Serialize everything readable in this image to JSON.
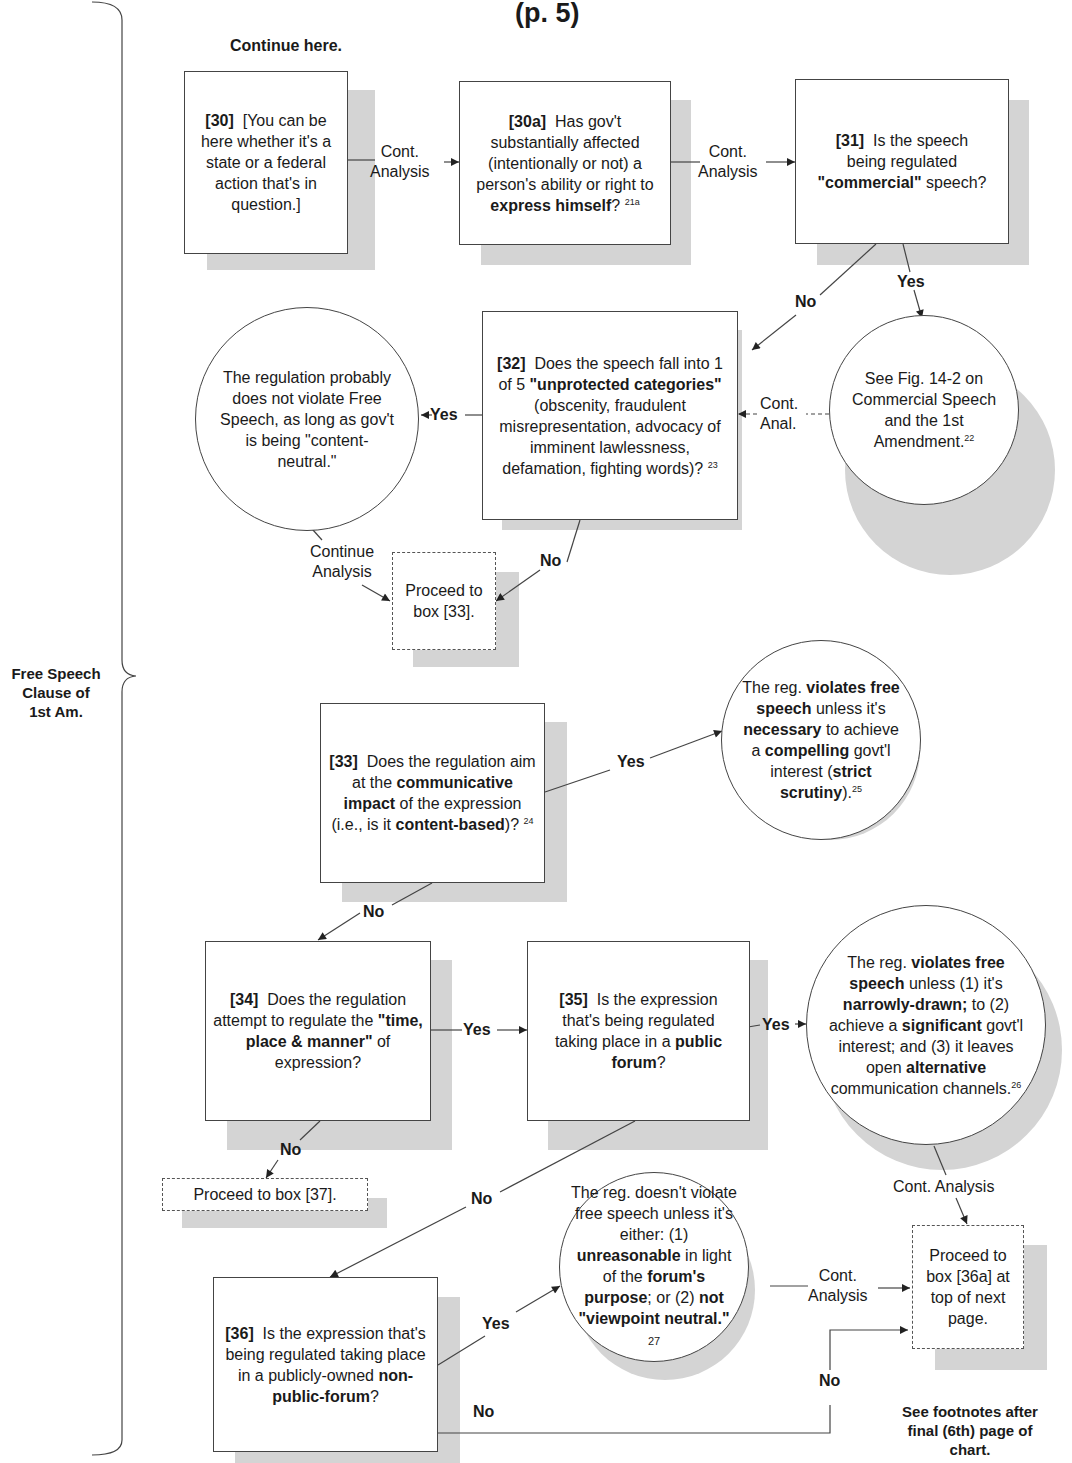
{
  "header": {
    "title": "(p. 5)",
    "continue_here": "Continue here."
  },
  "sidebar": {
    "brace_label_lines": [
      "Free Speech",
      "Clause of",
      "1st Am."
    ]
  },
  "nodes": {
    "n30": {
      "id": "[30]",
      "text": "[You can be here whether it's a state or a federal action that's in question.]"
    },
    "n30a": {
      "id": "[30a]",
      "text_pre": "Has gov't substantially affected (intentionally or not) a person's ability or right to ",
      "text_bold": "express himself",
      "text_post": "?",
      "footnote": "21a"
    },
    "n31": {
      "id": "[31]",
      "text_pre": "Is the speech being regulated ",
      "text_bold": "\"commercial\"",
      "text_post": " speech?"
    },
    "n32": {
      "id": "[32]",
      "text_pre": "Does the speech fall into 1 of 5 ",
      "text_bold": "\"unprotected categories\"",
      "text_post": " (obscenity, fraudulent misrepresentation, advocacy of imminent lawlessness, defamation, fighting words)?",
      "footnote": "23"
    },
    "circle_no_violation": {
      "text": "The regulation probably does not violate Free Speech, as long as gov't is being \"content-neutral.\""
    },
    "circle_commercial": {
      "text": "See Fig. 14-2 on Commercial Speech and the 1st Amendment.",
      "footnote": "22"
    },
    "proceed_33": {
      "text": "Proceed to box [33]."
    },
    "n33": {
      "id": "[33]",
      "t1": "Does the regulation aim at the ",
      "b1": "communicative impact",
      "t2": " of the expression (i.e., is it ",
      "b2": "content-based",
      "t3": ")?",
      "footnote": "24"
    },
    "circle_strict": {
      "t1": "The reg. ",
      "b1": "violates free speech",
      "t2": " unless it's ",
      "b2": "necessary",
      "t3": " to achieve a ",
      "b3": "compelling",
      "t4": " govt'l interest (",
      "b4": "strict scrutiny",
      "t5": ").",
      "footnote": "25"
    },
    "n34": {
      "id": "[34]",
      "text_pre": "Does the regulation attempt to regulate the ",
      "text_bold": "\"time, place & manner\"",
      "text_post": " of expression?"
    },
    "n35": {
      "id": "[35]",
      "text_pre": "Is the expression that's being regulated taking place in a ",
      "text_bold": "public forum",
      "text_post": "?"
    },
    "circle_tpm": {
      "t1": "The reg. ",
      "b1": "violates free speech",
      "t2": " unless (1) it's ",
      "b2": "narrowly-drawn;",
      "t3": " to (2) achieve a ",
      "b3": "significant",
      "t4": " govt'l interest; and (3) it leaves open ",
      "b4": "alternative",
      "t5": " communication channels.",
      "footnote": "26"
    },
    "proceed_37": {
      "text": "Proceed to box [37]."
    },
    "n36": {
      "id": "[36]",
      "text_pre": "Is the expression that's being regulated taking place in a publicly-owned ",
      "text_bold": "non-public-forum",
      "text_post": "?"
    },
    "circle_nonpublic": {
      "t1": "The reg. doesn't violate free speech unless it's either: (1) ",
      "b1": "unreasonable",
      "t2": " in light of the ",
      "b2": "forum's purpose",
      "t3": "; or (2) ",
      "b3": "not \"viewpoint neutral.\"",
      "footnote": "27"
    },
    "proceed_36a": {
      "text": "Proceed to box [36a] at top of next page."
    }
  },
  "edge_labels": {
    "e30_30a": [
      "Cont.",
      "Analysis"
    ],
    "e30a_31": [
      "Cont.",
      "Analysis"
    ],
    "e31_no": "No",
    "e31_yes": "Yes",
    "e32_yes": "Yes",
    "e_comm_32": [
      "Cont.",
      "Anal."
    ],
    "e_circ_proceed": [
      "Continue",
      "Analysis"
    ],
    "e32_no": "No",
    "e33_yes": "Yes",
    "e33_no": "No",
    "e34_yes": "Yes",
    "e34_no": "No",
    "e35_yes": "Yes",
    "e35_no": "No",
    "e_tpm_proceed": "Cont. Analysis",
    "e36_yes": "Yes",
    "e_nonpub_proceed": [
      "Cont.",
      "Analysis"
    ],
    "e36_no_low": "No",
    "e36_no_up": "No"
  },
  "footer": {
    "footnote_lines": [
      "See footnotes after",
      "final (6th) page of",
      "chart."
    ]
  }
}
